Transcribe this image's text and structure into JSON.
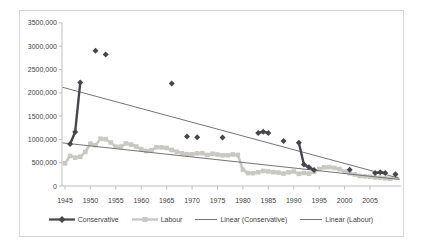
{
  "chart": {
    "background": "#ffffff",
    "frame_border_color": "#d6d6d6",
    "axis_color": "#bfbfbf",
    "text_color": "#3f3f3f"
  },
  "chart_data": {
    "type": "line",
    "title": "",
    "grid": "off",
    "legend_position": "bottom",
    "x_axis": {
      "tick_labels": [
        "1945",
        "1950",
        "1955",
        "1960",
        "1965",
        "1970",
        "1975",
        "1980",
        "1985",
        "1990",
        "1995",
        "2000",
        "2005"
      ],
      "range": [
        1944.4,
        2011.5
      ]
    },
    "y_axis": {
      "tick_labels": [
        "3500,000",
        "3000,000",
        "2500,000",
        "2000,000",
        "1500,000",
        "1000,000",
        "500,000",
        "0"
      ],
      "tick_values": [
        3500000,
        3000000,
        2500000,
        2000000,
        1500000,
        1000000,
        500000,
        0
      ],
      "range": [
        0,
        3500000
      ]
    },
    "series": [
      {
        "name": "Conservative",
        "marker": "diamond",
        "color": "#48454d",
        "points": [
          [
            1946,
            900000
          ],
          [
            1947,
            1160000
          ],
          [
            1948,
            2220000
          ],
          [
            1951,
            2900000
          ],
          [
            1953,
            2820000
          ],
          [
            1966,
            2200000
          ],
          [
            1969,
            1060000
          ],
          [
            1971,
            1045000
          ],
          [
            1976,
            1040000
          ],
          [
            1983,
            1140000
          ],
          [
            1984,
            1165000
          ],
          [
            1985,
            1140000
          ],
          [
            1988,
            965000
          ],
          [
            1991,
            930000
          ],
          [
            1992,
            460000
          ],
          [
            1993,
            400000
          ],
          [
            1994,
            345000
          ],
          [
            2001,
            350000
          ],
          [
            2006,
            280000
          ],
          [
            2007,
            295000
          ],
          [
            2008,
            280000
          ],
          [
            2010,
            250000
          ]
        ]
      },
      {
        "name": "Labour",
        "marker": "square",
        "color": "#c9c8c2",
        "points": [
          [
            1945,
            487000
          ],
          [
            1946,
            645000
          ],
          [
            1947,
            608000
          ],
          [
            1948,
            629000
          ],
          [
            1949,
            730000
          ],
          [
            1950,
            908000
          ],
          [
            1951,
            876000
          ],
          [
            1952,
            1015000
          ],
          [
            1953,
            1005000
          ],
          [
            1954,
            934000
          ],
          [
            1955,
            843000
          ],
          [
            1956,
            845000
          ],
          [
            1957,
            913000
          ],
          [
            1958,
            889000
          ],
          [
            1959,
            848000
          ],
          [
            1960,
            790000
          ],
          [
            1961,
            751000
          ],
          [
            1962,
            767000
          ],
          [
            1963,
            830000
          ],
          [
            1964,
            830000
          ],
          [
            1965,
            817000
          ],
          [
            1966,
            776000
          ],
          [
            1967,
            734000
          ],
          [
            1968,
            701000
          ],
          [
            1969,
            681000
          ],
          [
            1970,
            680000
          ],
          [
            1971,
            700000
          ],
          [
            1972,
            703000
          ],
          [
            1973,
            665000
          ],
          [
            1974,
            692000
          ],
          [
            1975,
            675000
          ],
          [
            1976,
            659000
          ],
          [
            1977,
            660000
          ],
          [
            1978,
            676000
          ],
          [
            1979,
            666000
          ],
          [
            1980,
            348000
          ],
          [
            1981,
            277000
          ],
          [
            1982,
            274000
          ],
          [
            1983,
            295000
          ],
          [
            1984,
            323000
          ],
          [
            1985,
            313000
          ],
          [
            1986,
            297000
          ],
          [
            1987,
            289000
          ],
          [
            1988,
            266000
          ],
          [
            1989,
            294000
          ],
          [
            1990,
            311000
          ],
          [
            1991,
            261000
          ],
          [
            1992,
            280000
          ],
          [
            1993,
            266000
          ],
          [
            1994,
            305000
          ],
          [
            1995,
            365000
          ],
          [
            1996,
            400000
          ],
          [
            1997,
            405000
          ],
          [
            1998,
            388000
          ],
          [
            1999,
            361000
          ],
          [
            2000,
            311000
          ],
          [
            2001,
            272000
          ],
          [
            2002,
            248000
          ],
          [
            2003,
            215000
          ],
          [
            2004,
            208000
          ],
          [
            2005,
            198000
          ],
          [
            2006,
            182000
          ],
          [
            2007,
            177000
          ],
          [
            2008,
            166000
          ],
          [
            2009,
            156000
          ],
          [
            2010,
            193000
          ]
        ]
      }
    ],
    "trendlines": [
      {
        "name": "Linear (Conservative)",
        "source": "Conservative",
        "color": "#757575"
      },
      {
        "name": "Linear (Labour)",
        "source": "Labour",
        "color": "#757575"
      }
    ]
  },
  "legend": {
    "items": [
      {
        "label": "Conservative",
        "marker": "line-diamond"
      },
      {
        "label": "Labour",
        "marker": "line-square"
      },
      {
        "label": "Linear (Conservative)",
        "marker": "line"
      },
      {
        "label": "Linear (Labour)",
        "marker": "line"
      }
    ]
  }
}
